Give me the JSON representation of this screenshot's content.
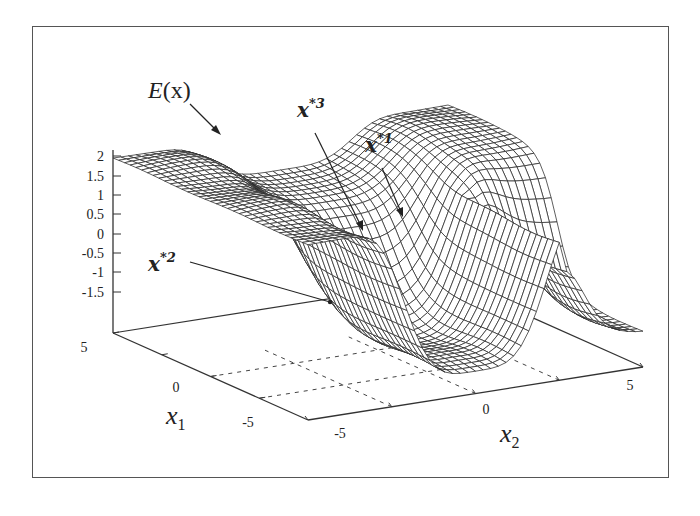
{
  "chart_data": {
    "type": "surface3d",
    "title": "",
    "zlabel": "E(x)",
    "xlabel": "x1",
    "ylabel": "x2",
    "x1_range": [
      -5,
      5
    ],
    "x2_range": [
      -5,
      5
    ],
    "zlim": [
      -2,
      2
    ],
    "z_ticks": [
      "2",
      "1.5",
      "1",
      "0.5",
      "0",
      "-0.5",
      "-1",
      "-1.5"
    ],
    "x1_ticks": [
      "5",
      "0",
      "-5"
    ],
    "x2_ticks": [
      "-5",
      "0",
      "5"
    ],
    "grid": "dashed floor grid",
    "annotations": [
      {
        "label": "x*1",
        "description": "local minimum in central valley (right side)"
      },
      {
        "label": "x*2",
        "description": "global minimum in front trough"
      },
      {
        "label": "x*3",
        "description": "saddle/minimum in central valley (left side)"
      }
    ],
    "surface_description": "Energy landscape with high plateaus (~1.8-2) at x2 extremes and a valley near x2≈0 that deepens toward negative x1 (min ≈ -2)"
  },
  "labels": {
    "energy": "E",
    "energy_arg": "(x)",
    "x1_main": "x",
    "x1_sub": "1",
    "x2_main": "x",
    "x2_sub": "2",
    "min1_main": "x",
    "min1_sup": "*1",
    "min2_main": "x",
    "min2_sup": "*2",
    "min3_main": "x",
    "min3_sup": "*3"
  },
  "z_ticks": [
    {
      "label": "2",
      "y": 156
    },
    {
      "label": "1.5",
      "y": 176
    },
    {
      "label": "1",
      "y": 195
    },
    {
      "label": "0.5",
      "y": 214
    },
    {
      "label": "0",
      "y": 234
    },
    {
      "label": "-0.5",
      "y": 253
    },
    {
      "label": "-1",
      "y": 272
    },
    {
      "label": "-1.5",
      "y": 292
    }
  ],
  "x1_ticks": [
    {
      "label": "5",
      "x": 84,
      "y": 352
    },
    {
      "label": "0",
      "x": 176,
      "y": 392
    },
    {
      "label": "-5",
      "x": 248,
      "y": 427
    }
  ],
  "x2_ticks": [
    {
      "label": "-5",
      "x": 340,
      "y": 438
    },
    {
      "label": "0",
      "x": 486,
      "y": 414
    },
    {
      "label": "5",
      "x": 630,
      "y": 390
    }
  ],
  "style": {
    "line_color": "#333333",
    "mesh_color": "#2a2a2a",
    "grid_color": "#444444"
  }
}
